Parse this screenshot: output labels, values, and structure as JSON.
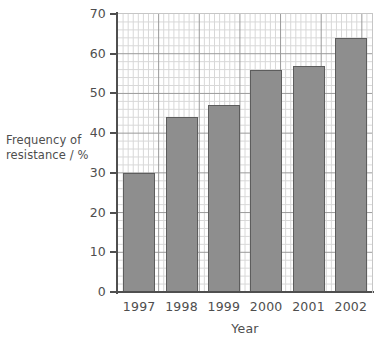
{
  "chart_data": {
    "type": "bar",
    "title": "",
    "subtitle": "",
    "xlabel": "Year",
    "ylabel": "Frequency of resistance / %",
    "ylabel_lines": [
      "Frequency of",
      "resistance / %"
    ],
    "categories": [
      "1997",
      "1998",
      "1999",
      "2000",
      "2001",
      "2002"
    ],
    "values": [
      30,
      44,
      47,
      56,
      57,
      64
    ],
    "ylim": [
      0,
      70
    ],
    "xlim_categories": 6,
    "y_ticks": [
      0,
      10,
      20,
      30,
      40,
      50,
      60,
      70
    ],
    "y_tick_labels": [
      "0",
      "10",
      "20",
      "30",
      "40",
      "50",
      "60",
      "70"
    ],
    "y_minor_step": 2,
    "grid": {
      "major": true,
      "minor": true,
      "major_color": "#9a9a9a",
      "minor_color": "#d8d8d8"
    },
    "legend": null,
    "legend_position": "none",
    "bar_fill_color": "#8e8e8e",
    "bar_edge_color": "#5d5d5d",
    "axis_color": "#4f4f4f",
    "text_color": "#4e4e4e",
    "background_color": "#ffffff"
  }
}
